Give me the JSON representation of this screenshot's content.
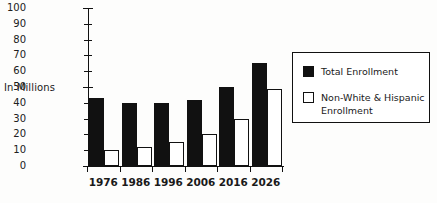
{
  "chart_data": {
    "type": "bar",
    "title": "",
    "xlabel": "",
    "ylabel": "In Millions",
    "categories": [
      "1976",
      "1986",
      "1996",
      "2006",
      "2016",
      "2026"
    ],
    "ylim": [
      0,
      100
    ],
    "ytick_step": 10,
    "yticks": [
      "100",
      "90",
      "80",
      "70",
      "60",
      "50",
      "40",
      "30",
      "20",
      "10",
      "0"
    ],
    "grid": false,
    "legend_position": "right",
    "series": [
      {
        "name": "Total Enrollment",
        "color": "#111111",
        "style": "filled",
        "values": [
          43,
          40,
          40,
          42,
          50,
          65
        ]
      },
      {
        "name": "Non-White & Hispanic Enrollment",
        "color": "#ffffff",
        "style": "hollow",
        "values": [
          10,
          12,
          15,
          20,
          30,
          49
        ]
      }
    ]
  },
  "legend": {
    "entries": [
      {
        "label": "Total Enrollment",
        "swatch": "filled-square-icon"
      },
      {
        "label": "Non-White & Hispanic Enrollment",
        "swatch": "hollow-square-icon"
      }
    ]
  },
  "colors": {
    "total_enrollment": "#111111",
    "minority_enrollment": "#ffffff",
    "axis": "#111111",
    "background": "#fdfdfc"
  }
}
